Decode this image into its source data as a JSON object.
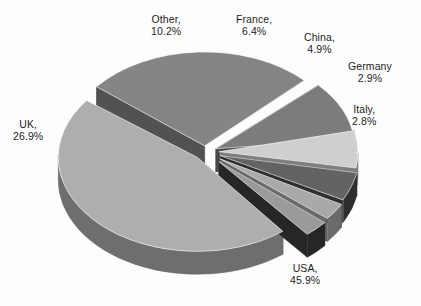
{
  "chart_data": {
    "type": "pie",
    "title": "",
    "subtitle": "",
    "xlabel": "",
    "ylabel": "",
    "legend_position": "none",
    "grid": false,
    "style": "3d-exploded-pie",
    "background_color": "#fdfdfd",
    "label_color": "#1d1d1d",
    "categories": [
      "France",
      "China",
      "Germany",
      "Italy",
      "USA",
      "UK",
      "Other"
    ],
    "values": [
      6.4,
      4.9,
      2.9,
      2.8,
      45.9,
      26.9,
      10.2
    ],
    "units": "%",
    "slices": [
      {
        "name": "France",
        "value": 6.4,
        "label_name": "France,",
        "label_value": "6.4%",
        "top_color": "#cfcfcf",
        "side_color": "#7e7e7e",
        "start_angle": -13.0,
        "sweep_angle": 23.0,
        "explode": 14,
        "label_x": 236,
        "label_y": 13
      },
      {
        "name": "China",
        "value": 4.9,
        "label_name": "China,",
        "label_value": "4.9%",
        "top_color": "#636363",
        "side_color": "#2e2e2e",
        "start_angle": 10.5,
        "sweep_angle": 17.6,
        "explode": 16,
        "label_x": 304,
        "label_y": 31
      },
      {
        "name": "Germany",
        "value": 2.9,
        "label_name": "Germany",
        "label_value": "2.9%",
        "top_color": "#a9a9a9",
        "side_color": "#6a6a6a",
        "start_angle": 29.0,
        "sweep_angle": 10.4,
        "explode": 18,
        "label_x": 348,
        "label_y": 60
      },
      {
        "name": "Italy",
        "value": 2.8,
        "label_name": "Italy,",
        "label_value": "2.8%",
        "top_color": "#9a9a9a",
        "side_color": "#262626",
        "start_angle": 40.5,
        "sweep_angle": 10.1,
        "explode": 20,
        "label_x": 352,
        "label_y": 103
      },
      {
        "name": "USA",
        "value": 45.9,
        "label_name": "USA,",
        "label_value": "45.9%",
        "top_color": "#aeaeae",
        "side_color": "#6e6e6e",
        "start_angle": 52.0,
        "sweep_angle": 165.2,
        "explode": 11,
        "label_x": 290,
        "label_y": 262
      },
      {
        "name": "UK",
        "value": 26.9,
        "label_name": "UK,",
        "label_value": "26.9%",
        "top_color": "#858585",
        "side_color": "#525252",
        "start_angle": 219.0,
        "sweep_angle": 96.8,
        "explode": 9,
        "label_x": 13,
        "label_y": 118
      },
      {
        "name": "Other",
        "value": 10.2,
        "label_name": "Other,",
        "label_value": "10.2%",
        "top_color": "#7c7c7c",
        "side_color": "#4d4d4d",
        "start_angle": 317.5,
        "sweep_angle": 36.7,
        "explode": 12,
        "label_x": 151,
        "label_y": 13
      }
    ],
    "geometry": {
      "center_x": 205,
      "center_y": 152,
      "radius_x": 139,
      "radius_y": 94,
      "depth": 23
    }
  }
}
